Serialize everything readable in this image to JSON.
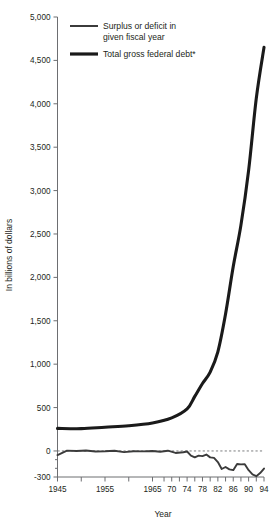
{
  "chart_data": {
    "type": "line",
    "title": "",
    "xlabel": "Year",
    "ylabel": "In billions of dollars",
    "xlim": [
      1945,
      1994
    ],
    "ylim": [
      -300,
      5000
    ],
    "grid": false,
    "legend_position": "top-left-inside",
    "zero_reference_line": true,
    "y_ticks": [
      {
        "value": 5000,
        "label": "5,000"
      },
      {
        "value": 4500,
        "label": "4,500"
      },
      {
        "value": 4000,
        "label": "4,000"
      },
      {
        "value": 3500,
        "label": "3,500"
      },
      {
        "value": 3000,
        "label": "3,000"
      },
      {
        "value": 2500,
        "label": "2,500"
      },
      {
        "value": 2000,
        "label": "2,000"
      },
      {
        "value": 1500,
        "label": "1,500"
      },
      {
        "value": 1000,
        "label": "1,000"
      },
      {
        "value": 500,
        "label": "500"
      },
      {
        "value": 0,
        "label": "0"
      },
      {
        "value": -300,
        "label": "-300"
      }
    ],
    "y_minor_ticks": [
      -100,
      -200
    ],
    "x_ticks": [
      {
        "value": 1945,
        "label": "1945"
      },
      {
        "value": 1950,
        "label": ""
      },
      {
        "value": 1955,
        "label": "1955"
      },
      {
        "value": 1960,
        "label": ""
      },
      {
        "value": 1965,
        "label": "1965"
      },
      {
        "value": 1968,
        "label": ""
      },
      {
        "value": 1970,
        "label": "70"
      },
      {
        "value": 1972,
        "label": ""
      },
      {
        "value": 1974,
        "label": "74"
      },
      {
        "value": 1976,
        "label": ""
      },
      {
        "value": 1978,
        "label": "78"
      },
      {
        "value": 1980,
        "label": ""
      },
      {
        "value": 1982,
        "label": "82"
      },
      {
        "value": 1984,
        "label": ""
      },
      {
        "value": 1986,
        "label": "86"
      },
      {
        "value": 1988,
        "label": ""
      },
      {
        "value": 1990,
        "label": "90"
      },
      {
        "value": 1992,
        "label": ""
      },
      {
        "value": 1994,
        "label": "94"
      }
    ],
    "series": [
      {
        "name": "Surplus or deficit in given fiscal year",
        "color": "#3b3b3b",
        "width": 1.9,
        "x": [
          1945,
          1947,
          1949,
          1951,
          1953,
          1955,
          1957,
          1959,
          1961,
          1963,
          1965,
          1967,
          1969,
          1971,
          1973,
          1974,
          1975,
          1976,
          1977,
          1978,
          1979,
          1980,
          1981,
          1982,
          1983,
          1984,
          1985,
          1986,
          1987,
          1988,
          1989,
          1990,
          1991,
          1992,
          1993,
          1994
        ],
        "y": [
          -48,
          4,
          -1,
          6,
          -6,
          -3,
          3,
          -13,
          -3,
          -5,
          -1,
          -9,
          3,
          -23,
          -15,
          -6,
          -53,
          -74,
          -54,
          -59,
          -41,
          -74,
          -79,
          -128,
          -208,
          -185,
          -212,
          -221,
          -150,
          -155,
          -152,
          -221,
          -269,
          -290,
          -255,
          -203
        ]
      },
      {
        "name": "Total gross federal debt*",
        "color": "#1a1a1a",
        "width": 3.1,
        "x": [
          1945,
          1950,
          1955,
          1960,
          1965,
          1970,
          1974,
          1976,
          1978,
          1980,
          1982,
          1984,
          1986,
          1988,
          1990,
          1992,
          1994
        ],
        "y": [
          260,
          257,
          274,
          291,
          323,
          381,
          484,
          629,
          777,
          909,
          1142,
          1577,
          2125,
          2602,
          3233,
          4065,
          4650
        ]
      }
    ],
    "legend": [
      {
        "label_line1": "Surplus or deficit in",
        "label_line2": "given fiscal year",
        "color": "#3b3b3b",
        "width": 2.0
      },
      {
        "label_line1": "Total gross federal debt*",
        "label_line2": "",
        "color": "#1a1a1a",
        "width": 3.2
      }
    ]
  },
  "axis": {
    "y_title": "In billions of dollars",
    "x_title": "Year"
  }
}
